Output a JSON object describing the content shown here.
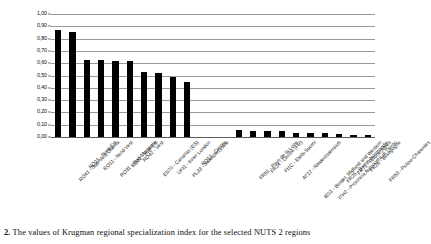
{
  "caption": {
    "number": "2.",
    "text": "The values of Krugman regional specialization index for the selected NUTS 2 regions"
  },
  "chart_data": {
    "type": "bar",
    "title": "",
    "xlabel": "",
    "ylabel": "",
    "ylim": [
      0.0,
      1.0
    ],
    "ytick_step": 0.1,
    "grid": true,
    "legend": false,
    "legend_position": "none",
    "bar_color": "#000000",
    "gridline_color": "#9a9a9a",
    "decimal_separator": ",",
    "ytick_labels": [
      "1,00",
      "0,90",
      "0,80",
      "0,70",
      "0,60",
      "0,50",
      "0,40",
      "0,30",
      "0,20",
      "0,10",
      "0,00"
    ],
    "ytick_values": [
      1.0,
      0.9,
      0.8,
      0.7,
      0.6,
      0.5,
      0.4,
      0.3,
      0.2,
      0.1,
      0.0
    ],
    "gap_after_index": 9,
    "categories": [
      "RO41 - Sud-Vest Oltenia",
      "RO21 - Nord-Est",
      "RO11 - Nord-Vest",
      "RO31 - Sud-Muntenia",
      "RO22 - Sud-Est",
      "RO42 - Vest",
      "ES70 - Canarias (ES)",
      "UKI1 - Inner London",
      "PL33 - Swietokrzyskie",
      "RO12 - Centru",
      "FR51 - Pays de la Loire",
      "FR24 - Centre (FR)",
      "FI1C - Etelä-Suomi",
      "AT12 - Niederösterreich",
      "IE01 - Border, Midland and Western",
      "ITH2 - Provincia Autonoma di Trento",
      "FR25 - Basse-Normandie",
      "FR71 - Rhône-Alpes",
      "FR26 - Bourgogne",
      "FR53 - Poitou-Charentes"
    ],
    "values": [
      0.87,
      0.85,
      0.63,
      0.63,
      0.62,
      0.62,
      0.53,
      0.52,
      0.49,
      0.45,
      0.055,
      0.052,
      0.05,
      0.048,
      0.035,
      0.033,
      0.03,
      0.028,
      0.018,
      0.015
    ]
  }
}
